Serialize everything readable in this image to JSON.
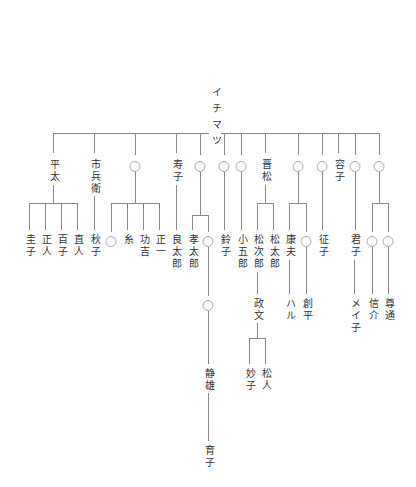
{
  "colors": {
    "line": "#888888",
    "text": "#333333",
    "unknown_circle": "#aaaaaa"
  },
  "unknown_symbol": "○",
  "nodes": [
    {
      "id": "root",
      "name": "イチマツ",
      "x": 215,
      "y": 86,
      "root": true
    },
    {
      "id": "heita",
      "name": "平太",
      "x": 53,
      "y": 158
    },
    {
      "id": "ichibee",
      "name": "市兵衛",
      "x": 94,
      "y": 158
    },
    {
      "id": "u1",
      "name": "",
      "x": 135,
      "y": 160,
      "unknown": true
    },
    {
      "id": "hisako",
      "name": "寿子",
      "x": 176,
      "y": 158
    },
    {
      "id": "u2",
      "name": "",
      "x": 200,
      "y": 160,
      "unknown": true
    },
    {
      "id": "u3",
      "name": "",
      "x": 224,
      "y": 160,
      "unknown": true
    },
    {
      "id": "u4",
      "name": "",
      "x": 241,
      "y": 160,
      "unknown": true
    },
    {
      "id": "shinmatsu",
      "name": "晋松",
      "x": 265,
      "y": 158
    },
    {
      "id": "u5",
      "name": "",
      "x": 298,
      "y": 160,
      "unknown": true
    },
    {
      "id": "u6",
      "name": "",
      "x": 322,
      "y": 160,
      "unknown": true
    },
    {
      "id": "yoko",
      "name": "容子",
      "x": 338,
      "y": 158
    },
    {
      "id": "u7",
      "name": "",
      "x": 355,
      "y": 160,
      "unknown": true
    },
    {
      "id": "u8",
      "name": "",
      "x": 379,
      "y": 160,
      "unknown": true
    },
    {
      "id": "keiko",
      "name": "圭子",
      "x": 29,
      "y": 233
    },
    {
      "id": "masato",
      "name": "正人",
      "x": 45,
      "y": 233
    },
    {
      "id": "momoko",
      "name": "百子",
      "x": 61,
      "y": 233
    },
    {
      "id": "naoto",
      "name": "直人",
      "x": 77,
      "y": 233
    },
    {
      "id": "akiko",
      "name": "秋子",
      "x": 94,
      "y": 233
    },
    {
      "id": "u9",
      "name": "",
      "x": 111,
      "y": 235,
      "unknown": true
    },
    {
      "id": "ito",
      "name": "糸",
      "x": 127,
      "y": 233
    },
    {
      "id": "isao",
      "name": "功吉",
      "x": 143,
      "y": 233
    },
    {
      "id": "shoichi",
      "name": "正一",
      "x": 159,
      "y": 233
    },
    {
      "id": "ryotaro",
      "name": "良太郎",
      "x": 175,
      "y": 233
    },
    {
      "id": "kotaro",
      "name": "孝太郎",
      "x": 192,
      "y": 233
    },
    {
      "id": "u10",
      "name": "",
      "x": 208,
      "y": 235,
      "unknown": true
    },
    {
      "id": "suzuko",
      "name": "鈴子",
      "x": 224,
      "y": 233
    },
    {
      "id": "kogoro",
      "name": "小五郎",
      "x": 241,
      "y": 233
    },
    {
      "id": "matsujiro",
      "name": "松次郎",
      "x": 257,
      "y": 233
    },
    {
      "id": "matsutaro",
      "name": "松太郎",
      "x": 273,
      "y": 233
    },
    {
      "id": "yasuo",
      "name": "康夫",
      "x": 289,
      "y": 233
    },
    {
      "id": "u11",
      "name": "",
      "x": 306,
      "y": 235,
      "unknown": true
    },
    {
      "id": "seiko",
      "name": "征子",
      "x": 322,
      "y": 233
    },
    {
      "id": "kimiko",
      "name": "君子",
      "x": 354,
      "y": 233
    },
    {
      "id": "u12",
      "name": "",
      "x": 372,
      "y": 235,
      "unknown": true
    },
    {
      "id": "u13",
      "name": "",
      "x": 388,
      "y": 235,
      "unknown": true
    },
    {
      "id": "u14",
      "name": "",
      "x": 208,
      "y": 299,
      "unknown": true
    },
    {
      "id": "masafumi",
      "name": "政文",
      "x": 257,
      "y": 297
    },
    {
      "id": "haru",
      "name": "ハル",
      "x": 289,
      "y": 297
    },
    {
      "id": "sohei",
      "name": "創平",
      "x": 306,
      "y": 297
    },
    {
      "id": "mei",
      "name": "メイ子",
      "x": 354,
      "y": 297
    },
    {
      "id": "shinsuke",
      "name": "信介",
      "x": 372,
      "y": 297
    },
    {
      "id": "takamichi",
      "name": "尊通",
      "x": 388,
      "y": 297
    },
    {
      "id": "shizuo",
      "name": "静雄",
      "x": 208,
      "y": 367
    },
    {
      "id": "taeko",
      "name": "妙子",
      "x": 249,
      "y": 367
    },
    {
      "id": "matsuto",
      "name": "松人",
      "x": 265,
      "y": 367
    },
    {
      "id": "ikuko",
      "name": "育子",
      "x": 208,
      "y": 444
    }
  ],
  "lines": [
    [
      215,
      118,
      215,
      133
    ],
    [
      53,
      133,
      379,
      133
    ],
    [
      53,
      133,
      53,
      153
    ],
    [
      94,
      133,
      94,
      153
    ],
    [
      135,
      133,
      135,
      155
    ],
    [
      176,
      133,
      176,
      153
    ],
    [
      200,
      133,
      200,
      155
    ],
    [
      224,
      133,
      224,
      155
    ],
    [
      241,
      133,
      241,
      155
    ],
    [
      265,
      133,
      265,
      153
    ],
    [
      298,
      133,
      298,
      155
    ],
    [
      322,
      133,
      322,
      155
    ],
    [
      338,
      133,
      338,
      153
    ],
    [
      355,
      133,
      355,
      155
    ],
    [
      379,
      133,
      379,
      155
    ],
    [
      53,
      185,
      53,
      203
    ],
    [
      29,
      203,
      77,
      203
    ],
    [
      29,
      203,
      29,
      230
    ],
    [
      45,
      203,
      45,
      230
    ],
    [
      61,
      203,
      61,
      230
    ],
    [
      77,
      203,
      77,
      230
    ],
    [
      94,
      196,
      94,
      230
    ],
    [
      135,
      172,
      135,
      203
    ],
    [
      111,
      203,
      159,
      203
    ],
    [
      111,
      203,
      111,
      232
    ],
    [
      127,
      203,
      127,
      230
    ],
    [
      143,
      203,
      143,
      230
    ],
    [
      159,
      203,
      159,
      230
    ],
    [
      176,
      185,
      176,
      230
    ],
    [
      200,
      172,
      200,
      215
    ],
    [
      192,
      215,
      208,
      215
    ],
    [
      192,
      215,
      192,
      230
    ],
    [
      208,
      215,
      208,
      232
    ],
    [
      224,
      172,
      224,
      230
    ],
    [
      241,
      172,
      241,
      230
    ],
    [
      265,
      185,
      265,
      203
    ],
    [
      257,
      203,
      273,
      203
    ],
    [
      257,
      203,
      257,
      230
    ],
    [
      273,
      203,
      273,
      230
    ],
    [
      298,
      172,
      298,
      203
    ],
    [
      289,
      203,
      306,
      203
    ],
    [
      289,
      203,
      289,
      230
    ],
    [
      306,
      203,
      306,
      232
    ],
    [
      322,
      172,
      322,
      230
    ],
    [
      355,
      172,
      355,
      230
    ],
    [
      379,
      172,
      379,
      203
    ],
    [
      372,
      203,
      388,
      203
    ],
    [
      372,
      203,
      372,
      232
    ],
    [
      388,
      203,
      388,
      232
    ],
    [
      208,
      247,
      208,
      296
    ],
    [
      257,
      272,
      257,
      294
    ],
    [
      289,
      260,
      289,
      294
    ],
    [
      306,
      247,
      306,
      294
    ],
    [
      354,
      260,
      354,
      294
    ],
    [
      372,
      247,
      372,
      294
    ],
    [
      388,
      247,
      388,
      294
    ],
    [
      208,
      311,
      208,
      364
    ],
    [
      257,
      322,
      257,
      338
    ],
    [
      249,
      338,
      265,
      338
    ],
    [
      249,
      338,
      249,
      364
    ],
    [
      265,
      338,
      265,
      364
    ],
    [
      208,
      392,
      208,
      441
    ]
  ]
}
